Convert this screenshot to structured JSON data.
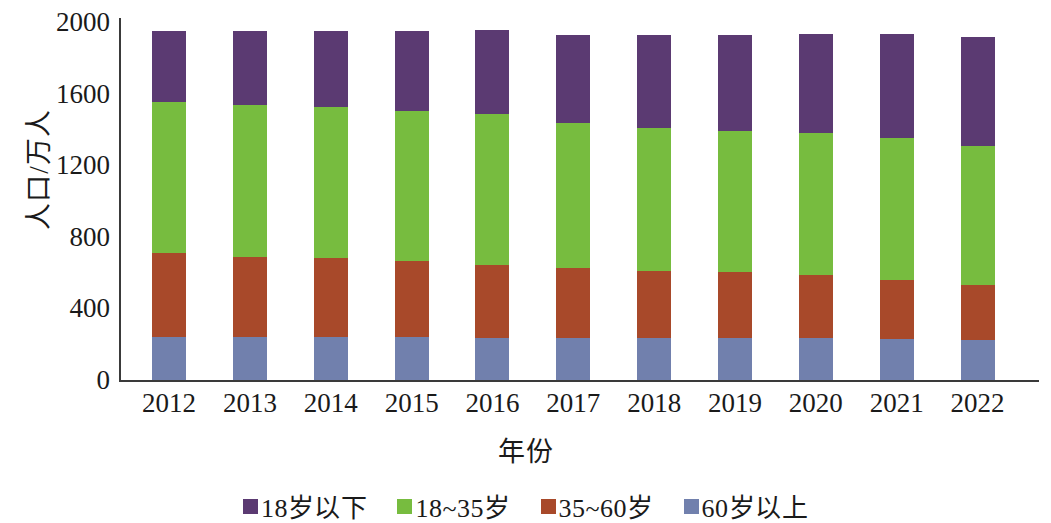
{
  "chart_data": {
    "type": "bar",
    "stacked": true,
    "title": "",
    "xlabel": "年份",
    "ylabel": "人口/万人",
    "categories": [
      "2012",
      "2013",
      "2014",
      "2015",
      "2016",
      "2017",
      "2018",
      "2019",
      "2020",
      "2021",
      "2022"
    ],
    "ylim": [
      0,
      2000
    ],
    "yticks": [
      0,
      400,
      800,
      1200,
      1600,
      2000
    ],
    "ytick_labels": [
      "0",
      "400",
      "800",
      "1200",
      "1600",
      "2000"
    ],
    "grid": false,
    "legend_position": "bottom",
    "series": [
      {
        "name": "60岁以上",
        "color": "#7180ad",
        "values": [
          240,
          240,
          240,
          238,
          235,
          235,
          235,
          233,
          235,
          230,
          225
        ]
      },
      {
        "name": "35~60岁",
        "color": "#a8492a",
        "values": [
          470,
          450,
          440,
          425,
          410,
          390,
          375,
          370,
          350,
          330,
          305
        ]
      },
      {
        "name": "18~35岁",
        "color": "#77bc3f",
        "values": [
          845,
          845,
          845,
          840,
          840,
          810,
          800,
          790,
          795,
          790,
          775
        ]
      },
      {
        "name": "18岁以下",
        "color": "#5b3a72",
        "values": [
          395,
          415,
          425,
          447,
          470,
          490,
          515,
          535,
          555,
          585,
          610
        ]
      }
    ],
    "totals": [
      1950,
      1950,
      1950,
      1950,
      1955,
      1925,
      1925,
      1928,
      1935,
      1935,
      1915
    ]
  },
  "legend": {
    "items": [
      {
        "label": "18岁以下",
        "color": "#5b3a72"
      },
      {
        "label": "18~35岁",
        "color": "#77bc3f"
      },
      {
        "label": "35~60岁",
        "color": "#a8492a"
      },
      {
        "label": "60岁以上",
        "color": "#7180ad"
      }
    ]
  },
  "axes": {
    "y_title": "人口/万人",
    "x_title": "年份"
  }
}
